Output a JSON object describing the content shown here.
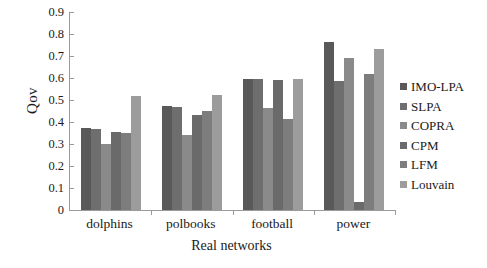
{
  "chart_data": {
    "type": "bar",
    "title": "",
    "xlabel": "Real networks",
    "ylabel": "Qov",
    "categories": [
      "dolphins",
      "polbooks",
      "football",
      "power"
    ],
    "ylim": [
      0,
      0.9
    ],
    "y_ticks": [
      "0",
      "0.1",
      "0.2",
      "0.3",
      "0.4",
      "0.5",
      "0.6",
      "0.7",
      "0.8",
      "0.9"
    ],
    "y_tick_values": [
      0,
      0.1,
      0.2,
      0.3,
      0.4,
      0.5,
      0.6,
      0.7,
      0.8,
      0.9
    ],
    "grid": false,
    "legend_position": "right",
    "series": [
      {
        "name": "IMO-LPA",
        "color": "#595959",
        "values": [
          0.375,
          0.472,
          0.596,
          0.765
        ]
      },
      {
        "name": "SLPA",
        "color": "#6e6e6e",
        "values": [
          0.37,
          0.468,
          0.594,
          0.585
        ]
      },
      {
        "name": "COPRA",
        "color": "#8a8a8a",
        "values": [
          0.3,
          0.342,
          0.462,
          0.69
        ]
      },
      {
        "name": "CPM",
        "color": "#6a6a6a",
        "values": [
          0.356,
          0.43,
          0.59,
          0.038
        ]
      },
      {
        "name": "LFM",
        "color": "#7d7d7d",
        "values": [
          0.352,
          0.452,
          0.414,
          0.62
        ]
      },
      {
        "name": "Louvain",
        "color": "#9c9c9c",
        "values": [
          0.518,
          0.524,
          0.596,
          0.732
        ]
      }
    ]
  }
}
